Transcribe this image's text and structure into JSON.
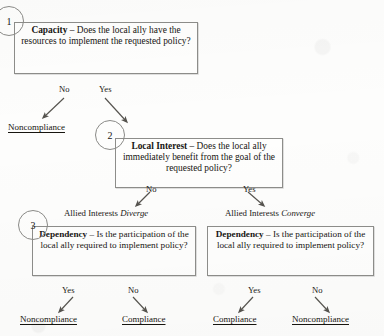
{
  "diagram": {
    "title_visible": false,
    "type": "decision-tree-flowchart",
    "ink_color": "#17150f",
    "box_border_color": "#8d8d8a",
    "nodes": [
      {
        "step_number": "1",
        "name": "capacity-box",
        "bold_lead": "Capacity",
        "dash": " – ",
        "text": "Does the local ally have the resources to implement the requested policy?"
      },
      {
        "step_number": "2",
        "name": "local-interest-box",
        "bold_lead": "Local Interest",
        "dash": " – ",
        "text": "Does the local ally immediately benefit from the goal of the requested policy?"
      },
      {
        "step_number": "3",
        "name": "dependency-box-left",
        "bold_lead": "Dependency",
        "dash": " – ",
        "text": "Is the participation of the local ally required to implement policy?"
      },
      {
        "step_number": "",
        "name": "dependency-box-right",
        "bold_lead": "Dependency",
        "dash": " – ",
        "text": "Is the participation of the local ally required to implement policy?"
      }
    ],
    "branch_labels": {
      "capacity_no": "No",
      "capacity_yes": "Yes",
      "local_interest_no": "No",
      "local_interest_yes": "Yes",
      "dep_left_yes": "Yes",
      "dep_left_no": "No",
      "dep_right_yes": "Yes",
      "dep_right_no": "No"
    },
    "interest_states": {
      "diverge_prefix": "Allied Interests ",
      "diverge_word": "Diverge",
      "converge_prefix": "Allied Interests ",
      "converge_word": "Converge"
    },
    "outcomes": {
      "capacity_no": "Noncompliance",
      "dep_left_yes": "Noncompliance",
      "dep_left_no": "Compliance",
      "dep_right_yes": "Compliance",
      "dep_right_no": "Noncompliance"
    }
  }
}
